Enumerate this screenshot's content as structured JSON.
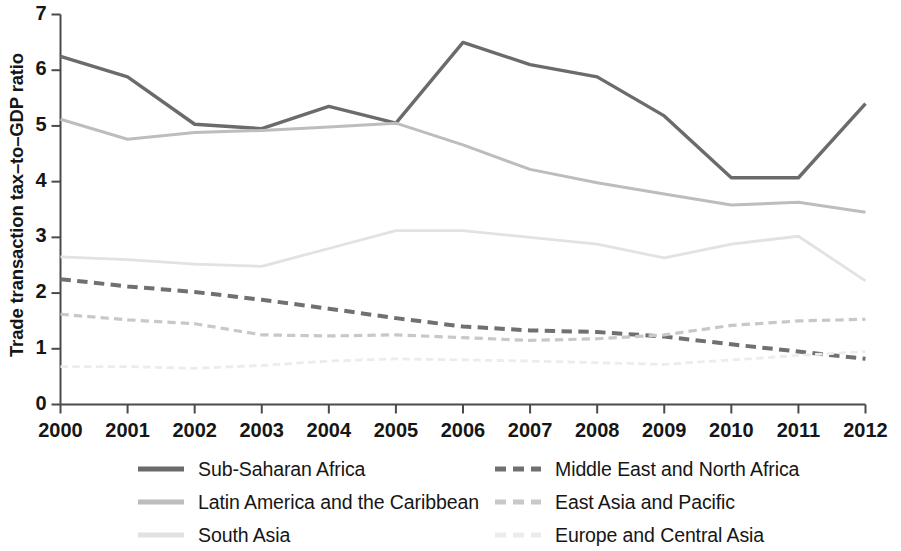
{
  "chart_data": {
    "type": "line",
    "title": "",
    "xlabel": "",
    "ylabel": "Trade transaction tax–to–GDP ratio",
    "x": [
      2000,
      2001,
      2002,
      2003,
      2004,
      2005,
      2006,
      2007,
      2008,
      2009,
      2010,
      2011,
      2012
    ],
    "categories": [
      "2000",
      "2001",
      "2002",
      "2003",
      "2004",
      "2005",
      "2006",
      "2007",
      "2008",
      "2009",
      "2010",
      "2011",
      "2012"
    ],
    "xlim": [
      2000,
      2012
    ],
    "ylim": [
      0,
      7
    ],
    "yticks": [
      0,
      1,
      2,
      3,
      4,
      5,
      6,
      7
    ],
    "ytick_labels": [
      "0",
      "1",
      "2",
      "3",
      "4",
      "5",
      "6",
      "7"
    ],
    "grid": false,
    "legend_position": "bottom",
    "series": [
      {
        "name": "Sub-Saharan Africa",
        "color": "#6b6b6b",
        "style": "solid",
        "width": 3.4,
        "values": [
          6.25,
          5.88,
          5.03,
          4.95,
          5.35,
          5.05,
          6.5,
          6.1,
          5.88,
          5.18,
          4.07,
          4.07,
          5.4
        ]
      },
      {
        "name": "Latin America and the Caribbean",
        "color": "#bdbdbd",
        "style": "solid",
        "width": 3.0,
        "values": [
          5.12,
          4.76,
          4.88,
          4.92,
          4.98,
          5.05,
          4.66,
          4.22,
          3.98,
          3.78,
          3.58,
          3.63,
          3.45
        ]
      },
      {
        "name": "South Asia",
        "color": "#e2e2e2",
        "style": "solid",
        "width": 2.8,
        "values": [
          2.65,
          2.6,
          2.52,
          2.48,
          2.8,
          3.12,
          3.12,
          3.0,
          2.88,
          2.63,
          2.88,
          3.02,
          2.22
        ]
      },
      {
        "name": "Middle East and North Africa",
        "color": "#707070",
        "style": "dashed",
        "width": 4.0,
        "values": [
          2.25,
          2.12,
          2.02,
          1.88,
          1.72,
          1.55,
          1.4,
          1.33,
          1.3,
          1.22,
          1.08,
          0.95,
          0.82
        ]
      },
      {
        "name": "East Asia and Pacific",
        "color": "#c8c8c8",
        "style": "dashed",
        "width": 3.2,
        "values": [
          1.62,
          1.52,
          1.45,
          1.25,
          1.23,
          1.25,
          1.2,
          1.15,
          1.18,
          1.25,
          1.42,
          1.5,
          1.53
        ]
      },
      {
        "name": "Europe and Central Asia",
        "color": "#ececec",
        "style": "dashed",
        "width": 2.8,
        "values": [
          0.68,
          0.68,
          0.65,
          0.7,
          0.78,
          0.82,
          0.8,
          0.78,
          0.75,
          0.72,
          0.8,
          0.88,
          0.95
        ]
      }
    ]
  },
  "axis": {
    "color": "#4a4a4a"
  },
  "legend": {
    "items": [
      {
        "label": "Sub-Saharan Africa",
        "color": "#6b6b6b",
        "style": "solid",
        "width": 5
      },
      {
        "label": "Middle East and North Africa",
        "color": "#707070",
        "style": "dashed",
        "width": 5
      },
      {
        "label": "Latin America and the Caribbean",
        "color": "#bdbdbd",
        "style": "solid",
        "width": 5
      },
      {
        "label": "East Asia and Pacific",
        "color": "#c8c8c8",
        "style": "dashed",
        "width": 5
      },
      {
        "label": "South Asia",
        "color": "#e2e2e2",
        "style": "solid",
        "width": 5
      },
      {
        "label": "Europe and Central Asia",
        "color": "#ececec",
        "style": "dashed",
        "width": 5
      }
    ]
  }
}
